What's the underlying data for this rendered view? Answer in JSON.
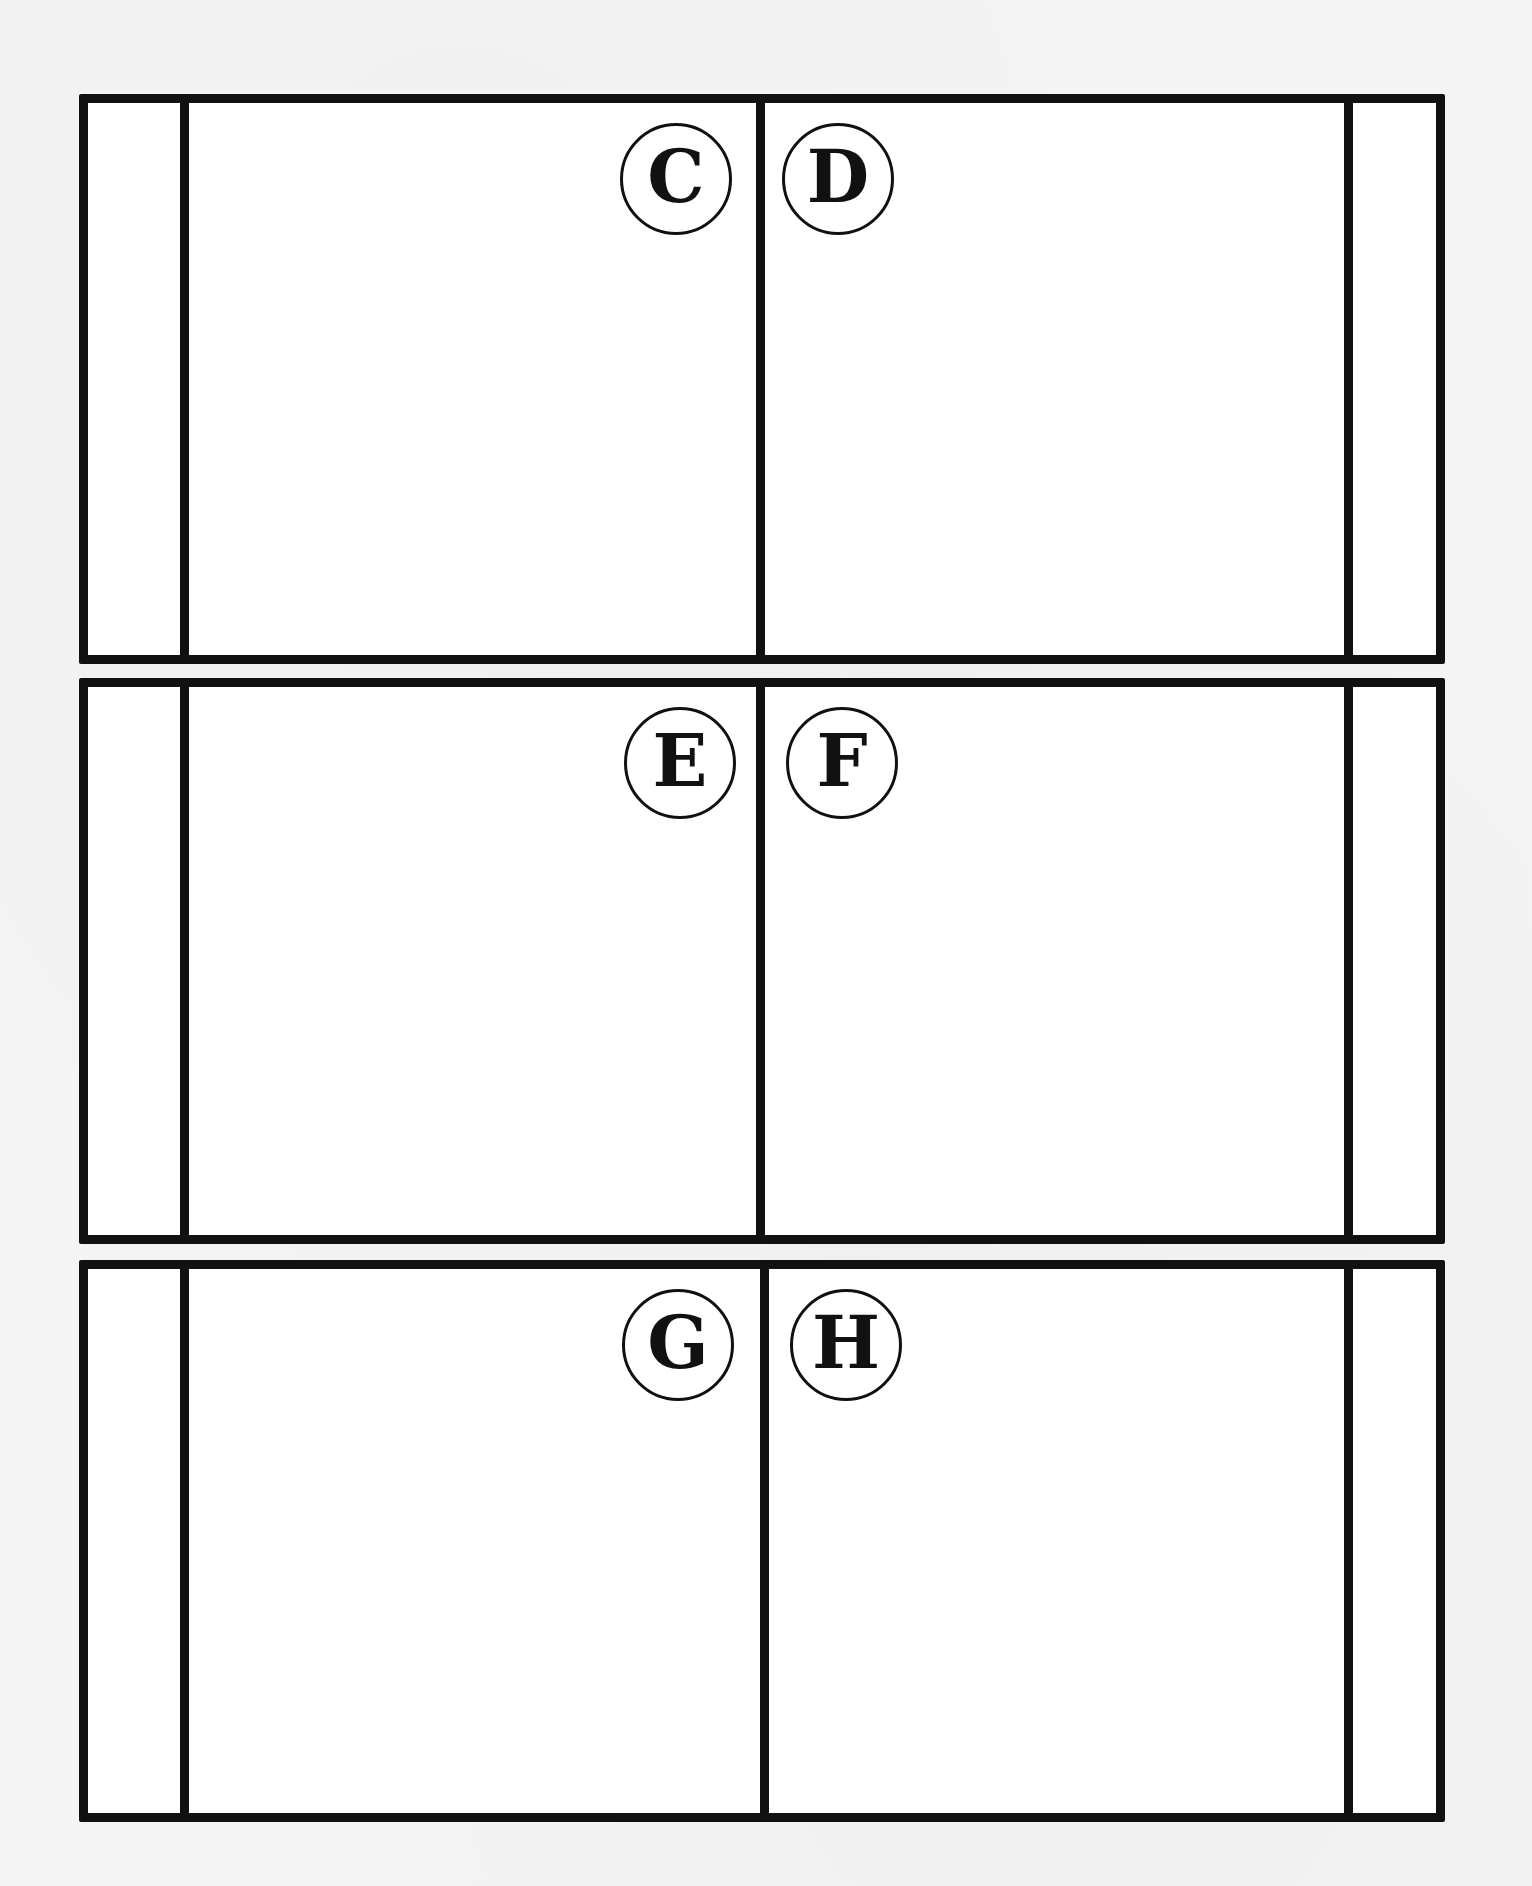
{
  "page": {
    "type": "foldable booklet template",
    "background_color": "#f5f5f5",
    "line_color": "#111111"
  },
  "panels": [
    {
      "left_label": "C",
      "right_label": "D"
    },
    {
      "left_label": "E",
      "right_label": "F"
    },
    {
      "left_label": "G",
      "right_label": "H"
    }
  ]
}
